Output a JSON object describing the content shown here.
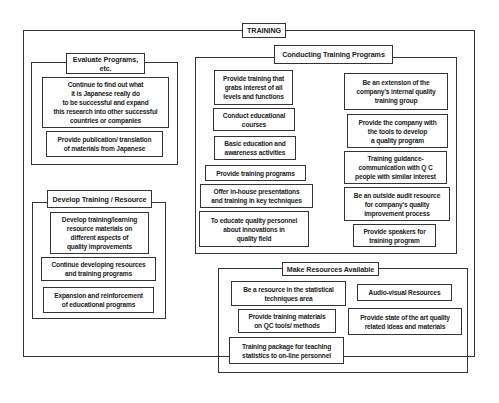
{
  "diagram": {
    "title": "TRAINING",
    "groups": {
      "evaluate": {
        "title": "Evaluate Programs,\netc.",
        "items": [
          "Continue to find out what\nit is Japanese really do\nto be successful and expand\nthis research into other successful\ncountries or companies",
          "Provide publication/ translation\nof materials from Japanese"
        ]
      },
      "develop": {
        "title": "Develop Training / Resource",
        "items": [
          "Develop training/learning\nresource materials on\ndifferent aspects of\nquality improvements",
          "Continue developing resources\nand training programs",
          "Expansion and reinforcement\nof educational programs"
        ]
      },
      "conducting": {
        "title": "Conducting Training Programs",
        "left_items": [
          "Provide training that\ngrabs interest of all\nlevels and functions",
          "Conduct educational\ncourses",
          "Basic education and\nawareness activities",
          "Provide training programs",
          "Offer in-house presentations\nand training in key techniques",
          "To educate quality personnel\nabout innovations in\nquality field"
        ],
        "right_items": [
          "Be an extension of the\ncompany's internal quality\ntraining group",
          "Provide the company with\nthe tools to develop\na quality program",
          "Training guidance-\ncommunication with Q C\npeople with similar interest",
          "Be an outside audit resource\nfor company's quality\nimprovement process",
          "Provide speakers for\ntraining program"
        ]
      },
      "resources": {
        "title": "Make Resources Available",
        "items": [
          "Be a resource in the statistical\ntechniques area",
          "Audio-visual Resources",
          "Provide training materials\non QC tools/ methods",
          "Provide state of the art quality\nrelated ideas and materials",
          "Training package for teaching\nstatistics to on-line personnel"
        ]
      }
    }
  }
}
